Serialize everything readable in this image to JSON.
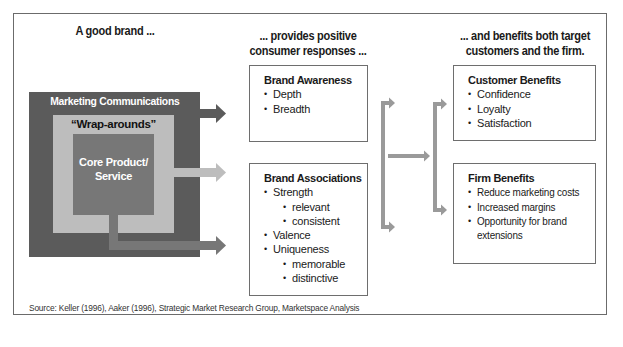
{
  "headings": {
    "brand": "A good brand ...",
    "responses_line1": "... provides positive",
    "responses_line2": "consumer responses ...",
    "benefits_line1": "... and benefits both target",
    "benefits_line2": "customers and the firm."
  },
  "brand_layers": {
    "outer": "Marketing Communications",
    "middle": "“Wrap-arounds”",
    "core_line1": "Core Product/",
    "core_line2": "Service"
  },
  "brand_awareness": {
    "title": "Brand Awareness",
    "items": [
      "Depth",
      "Breadth"
    ]
  },
  "brand_associations": {
    "title": "Brand Associations",
    "items": [
      {
        "label": "Strength",
        "level": 1
      },
      {
        "label": "relevant",
        "level": 2
      },
      {
        "label": "consistent",
        "level": 2
      },
      {
        "label": "Valence",
        "level": 1
      },
      {
        "label": "Uniqueness",
        "level": 1
      },
      {
        "label": "memorable",
        "level": 2
      },
      {
        "label": "distinctive",
        "level": 2
      }
    ]
  },
  "customer_benefits": {
    "title": "Customer Benefits",
    "items": [
      "Confidence",
      "Loyalty",
      "Satisfaction"
    ]
  },
  "firm_benefits": {
    "title": "Firm Benefits",
    "items": [
      "Reduce marketing costs",
      "Increased margins",
      "Opportunity for brand",
      "extensions"
    ]
  },
  "source": "Source: Keller (1996), Aaker (1996), Strategic Market Research Group, Marketspace Analysis",
  "colors": {
    "marketing_communications": "#5b5b5b",
    "wrap_arounds": "#bdbdbd",
    "core_product": "#777777",
    "connector": "#9a9a9a"
  }
}
